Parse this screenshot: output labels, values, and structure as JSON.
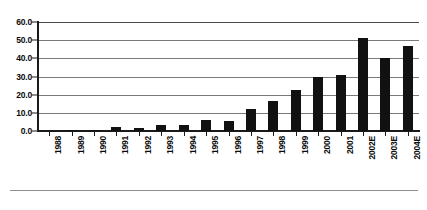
{
  "chart_data": {
    "type": "bar",
    "title": "",
    "subtitle": "",
    "xlabel": "",
    "ylabel": "",
    "categories": [
      "1988",
      "1989",
      "1990",
      "1991",
      "1992",
      "1993",
      "1994",
      "1995",
      "1996",
      "1997",
      "1998",
      "1999",
      "2000",
      "2001",
      "2002E",
      "2003E",
      "2004E"
    ],
    "values": [
      0.0,
      0.7,
      0.8,
      2.2,
      1.8,
      3.5,
      3.5,
      6.0,
      5.5,
      12.0,
      16.5,
      22.5,
      30.0,
      31.0,
      51.0,
      40.0,
      47.0
    ],
    "ylim": [
      0,
      60
    ],
    "ytick_values": [
      0.0,
      10.0,
      20.0,
      30.0,
      40.0,
      50.0,
      60.0
    ],
    "ytick_labels": [
      "0.0",
      "10.0",
      "20.0",
      "30.0",
      "40.0",
      "50.0",
      "60.0"
    ],
    "grid": true,
    "grid_axis": "y",
    "legend": false,
    "legend_position": "none",
    "bar_color": "#111111",
    "gridline_color": "#7a7a7a",
    "axis_color": "#1a1a1a",
    "background_color": "#ffffff",
    "xtick_label_rotation": -90,
    "annotations": []
  }
}
